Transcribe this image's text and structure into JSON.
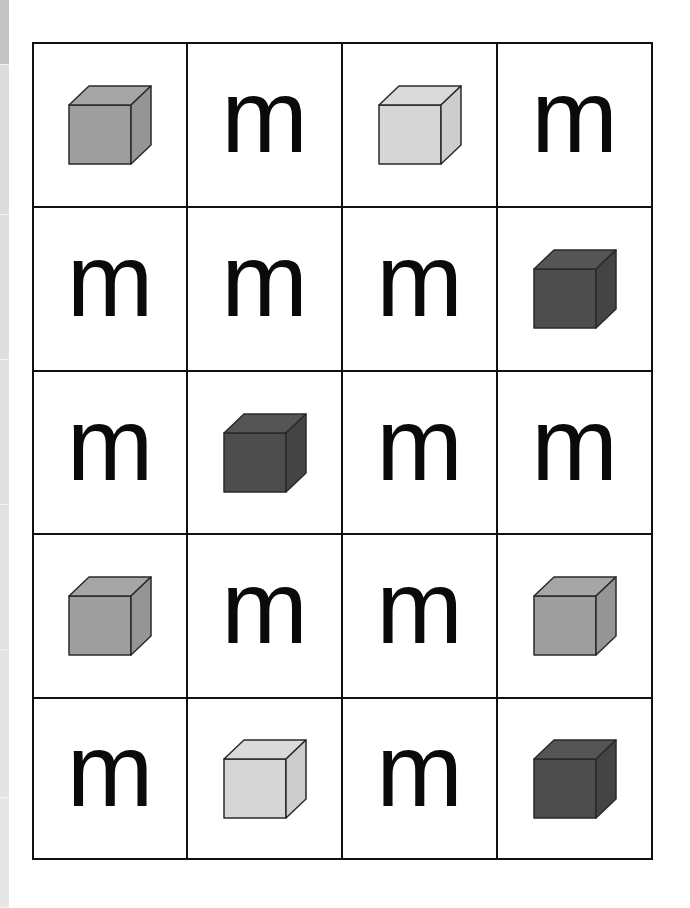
{
  "page": {
    "background": "#ffffff",
    "edge_strip": {
      "segments": [
        {
          "height": 65,
          "color": "#c4c4c4"
        },
        {
          "height": 150,
          "color": "#dcdcdc"
        },
        {
          "height": 145,
          "color": "#dedede"
        },
        {
          "height": 145,
          "color": "#e0e0e0"
        },
        {
          "height": 145,
          "color": "#e2e2e2"
        },
        {
          "height": 148,
          "color": "#e4e4e4"
        },
        {
          "height": 110,
          "color": "#e6e6e6"
        }
      ]
    }
  },
  "cube_colors": {
    "dark": {
      "front": "#4d4d4d",
      "top": "#555555",
      "side": "#444444"
    },
    "medium": {
      "front": "#9e9e9e",
      "top": "#a6a6a6",
      "side": "#959595"
    },
    "light": {
      "front": "#d6d6d6",
      "top": "#dadada",
      "side": "#cdcdcd"
    }
  },
  "grid": {
    "rows": 5,
    "cols": 4,
    "cells": [
      {
        "type": "cube",
        "shade": "medium"
      },
      {
        "type": "letter",
        "text": "m"
      },
      {
        "type": "cube",
        "shade": "light"
      },
      {
        "type": "letter",
        "text": "m"
      },
      {
        "type": "letter",
        "text": "m"
      },
      {
        "type": "letter",
        "text": "m"
      },
      {
        "type": "letter",
        "text": "m"
      },
      {
        "type": "cube",
        "shade": "dark"
      },
      {
        "type": "letter",
        "text": "m"
      },
      {
        "type": "cube",
        "shade": "dark"
      },
      {
        "type": "letter",
        "text": "m"
      },
      {
        "type": "letter",
        "text": "m"
      },
      {
        "type": "cube",
        "shade": "medium"
      },
      {
        "type": "letter",
        "text": "m"
      },
      {
        "type": "letter",
        "text": "m"
      },
      {
        "type": "cube",
        "shade": "medium"
      },
      {
        "type": "letter",
        "text": "m"
      },
      {
        "type": "cube",
        "shade": "light"
      },
      {
        "type": "letter",
        "text": "m"
      },
      {
        "type": "cube",
        "shade": "dark"
      }
    ]
  }
}
